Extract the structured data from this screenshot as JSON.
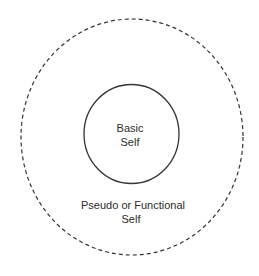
{
  "diagram": {
    "type": "concentric-circles",
    "outer": {
      "label_lines": [
        "Pseudo or Functional",
        "Self"
      ],
      "border_style": "dashed"
    },
    "inner": {
      "label_lines": [
        "Basic",
        "Self"
      ],
      "border_style": "solid"
    },
    "colors": {
      "stroke": "#333333",
      "text": "#2b2b2b",
      "background": "#ffffff"
    }
  }
}
